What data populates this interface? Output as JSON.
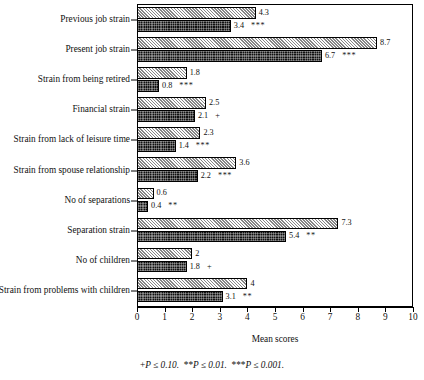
{
  "chart_data": {
    "type": "bar",
    "orientation": "horizontal",
    "title": "",
    "xlabel": "Mean scores",
    "ylabel": "",
    "xlim": [
      0,
      10
    ],
    "xticks": [
      0,
      1,
      2,
      3,
      4,
      5,
      6,
      7,
      8,
      9,
      10
    ],
    "grid": false,
    "legend": "none",
    "categories": [
      "Previous job strain",
      "Present job strain",
      "Strain from being retired",
      "Financial strain",
      "Strain from lack of leisure time",
      "Strain from spouse relationship",
      "No of separations",
      "Separation strain",
      "No of children",
      "Strain from problems with children"
    ],
    "series": [
      {
        "name": "light-hatched",
        "values": [
          4.3,
          8.7,
          1.8,
          2.5,
          2.3,
          3.6,
          0.6,
          7.3,
          2,
          4
        ],
        "labels": [
          "4.3",
          "8.7",
          "1.8",
          "2.5",
          "2.3",
          "3.6",
          "0.6",
          "7.3",
          "2",
          "4"
        ]
      },
      {
        "name": "dark-checkered",
        "values": [
          3.4,
          6.7,
          0.8,
          2.1,
          1.4,
          2.2,
          0.4,
          5.4,
          1.8,
          3.1
        ],
        "labels": [
          "3.4",
          "6.7",
          "0.8",
          "2.1",
          "1.4",
          "2.2",
          "0.4",
          "5.4",
          "1.8",
          "3.1"
        ],
        "significance": [
          "***",
          "***",
          "***",
          "+",
          "***",
          "***",
          "**",
          "**",
          "+",
          "**"
        ]
      }
    ],
    "footnote_parts": {
      "p1_marker": "+",
      "p1_text": "P ≤ 0.10.",
      "p2_marker": "**",
      "p2_text": "P ≤ 0.01.",
      "p3_marker": "***",
      "p3_text": "P ≤ 0.001."
    }
  }
}
